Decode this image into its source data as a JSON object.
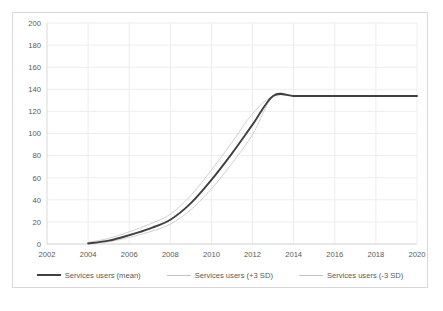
{
  "chart_data": {
    "type": "line",
    "title": "",
    "subtitle": "",
    "xlabel": "",
    "ylabel": "",
    "xlim": [
      2002,
      2020
    ],
    "ylim": [
      0,
      200
    ],
    "grid": true,
    "legend_position": "bottom",
    "x_ticks": [
      "2002",
      "2004",
      "2006",
      "2008",
      "2010",
      "2012",
      "2014",
      "2016",
      "2018",
      "2020"
    ],
    "y_ticks": [
      "0",
      "20",
      "40",
      "60",
      "80",
      "100",
      "120",
      "140",
      "160",
      "180",
      "200"
    ],
    "x": [
      2002,
      2003,
      2004,
      2005,
      2006,
      2007,
      2008,
      2009,
      2010,
      2011,
      2012,
      2013,
      2014,
      2015,
      2016,
      2017,
      2018,
      2019,
      2020
    ],
    "series": [
      {
        "name": "Services users (mean)",
        "color": "#404040",
        "width": 1.9,
        "values": [
          null,
          null,
          0.5,
          3,
          8,
          14,
          22,
          37,
          58,
          82,
          108,
          134,
          134,
          134,
          134,
          134,
          134,
          134,
          134
        ]
      },
      {
        "name": "Services users (+3 SD)",
        "color": "#c4c4c4",
        "width": 0.8,
        "values": [
          null,
          null,
          1.5,
          5,
          11,
          18,
          27,
          44,
          67,
          92,
          118,
          134,
          134,
          134,
          134,
          134,
          134,
          134,
          134
        ]
      },
      {
        "name": "Services users (-3 SD)",
        "color": "#c4c4c4",
        "width": 0.8,
        "values": [
          null,
          null,
          0.2,
          2,
          6,
          11,
          18,
          31,
          50,
          73,
          99,
          134,
          134,
          134,
          134,
          134,
          134,
          134,
          134
        ]
      }
    ],
    "plateau_value": 134,
    "plateau_start_year": 2013,
    "series_start_year": 2004,
    "colors": {
      "mean_line": "#404040",
      "band_line": "#c4c4c4",
      "gridline": "#ededed",
      "axis": "#d9d9d9",
      "tick_text": "#595959",
      "frame": "#d9d9d9",
      "background": "#ffffff"
    }
  },
  "legend": {
    "items": [
      {
        "label": "Services users (mean)",
        "style": "mean"
      },
      {
        "label": "Services users (+3 SD)",
        "style": "band"
      },
      {
        "label": "Services users (-3 SD)",
        "style": "band"
      }
    ]
  },
  "caption": {
    "text": ""
  }
}
